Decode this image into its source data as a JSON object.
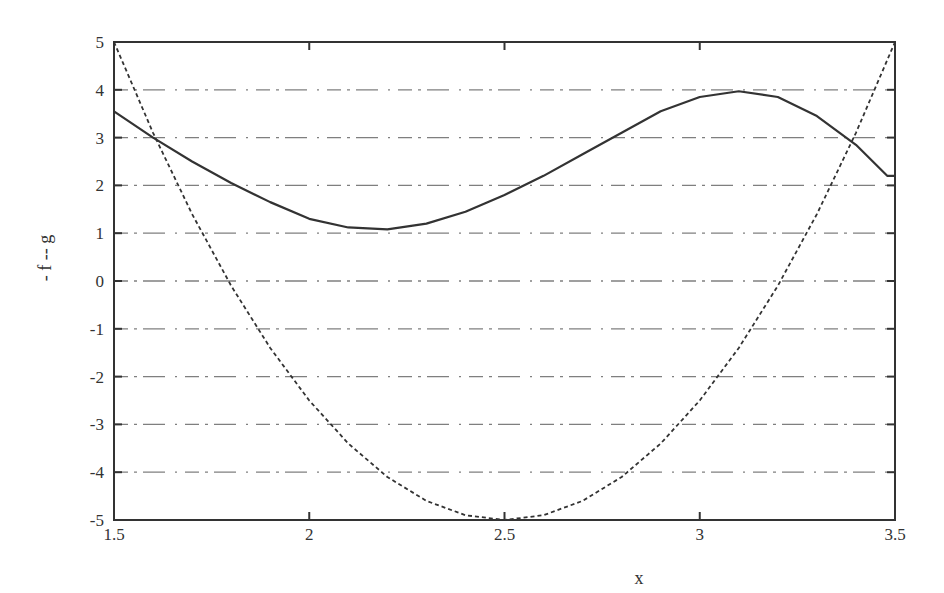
{
  "chart_data": {
    "type": "line",
    "title": "",
    "xlabel": "x",
    "ylabel": "- f    -- g",
    "xlim": [
      1.5,
      3.5
    ],
    "ylim": [
      -5,
      5
    ],
    "xticks": [
      "1.5",
      "2",
      "2.5",
      "3",
      "3.5"
    ],
    "yticks": [
      "5",
      "4",
      "3",
      "2",
      "1",
      "0",
      "-1",
      "-2",
      "-3",
      "-4",
      "-5"
    ],
    "grid": "horizontal dash-dot",
    "legend": "none (encoded in y-axis label)",
    "series": [
      {
        "name": "f",
        "style": "solid",
        "x": [
          1.5,
          1.6,
          1.7,
          1.8,
          1.9,
          2.0,
          2.1,
          2.2,
          2.3,
          2.4,
          2.5,
          2.6,
          2.7,
          2.8,
          2.9,
          3.0,
          3.1,
          3.2,
          3.3,
          3.4,
          3.48,
          3.5
        ],
        "y": [
          3.55,
          3.0,
          2.5,
          2.05,
          1.65,
          1.3,
          1.12,
          1.08,
          1.2,
          1.45,
          1.8,
          2.2,
          2.65,
          3.1,
          3.55,
          3.85,
          3.97,
          3.85,
          3.45,
          2.85,
          2.2,
          2.2
        ]
      },
      {
        "name": "g",
        "style": "dotted",
        "x": [
          1.5,
          1.6,
          1.7,
          1.8,
          1.9,
          2.0,
          2.1,
          2.2,
          2.3,
          2.4,
          2.5,
          2.6,
          2.7,
          2.8,
          2.9,
          3.0,
          3.1,
          3.2,
          3.3,
          3.4,
          3.5
        ],
        "y": [
          5.0,
          3.1,
          1.4,
          -0.1,
          -1.4,
          -2.5,
          -3.4,
          -4.1,
          -4.6,
          -4.9,
          -5.0,
          -4.9,
          -4.6,
          -4.1,
          -3.4,
          -2.5,
          -1.4,
          -0.1,
          1.4,
          3.1,
          5.0
        ]
      }
    ]
  }
}
